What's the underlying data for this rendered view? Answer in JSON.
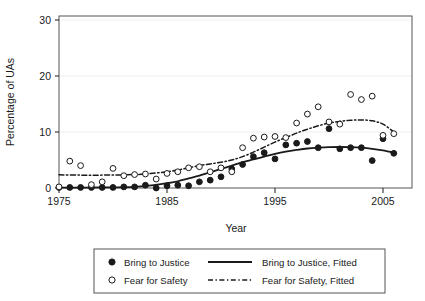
{
  "chart_data": {
    "type": "scatter",
    "title": "",
    "xlabel": "Year",
    "ylabel": "Percentage of UAs",
    "xlim": [
      1975,
      2007
    ],
    "ylim": [
      0,
      31
    ],
    "xticks": [
      1975,
      1985,
      1995,
      2005
    ],
    "yticks": [
      0,
      10,
      20,
      30
    ],
    "grid": "horizontal-faint",
    "legend_position": "below-plot",
    "x": [
      1975,
      1976,
      1977,
      1978,
      1979,
      1980,
      1981,
      1982,
      1983,
      1984,
      1985,
      1986,
      1987,
      1988,
      1989,
      1990,
      1991,
      1992,
      1993,
      1994,
      1995,
      1996,
      1997,
      1998,
      1999,
      2000,
      2001,
      2002,
      2003,
      2004,
      2005,
      2006
    ],
    "series": [
      {
        "name": "Bring to Justice",
        "marker": "filled-circle",
        "values": [
          0.1,
          0.1,
          0.1,
          0.1,
          0.1,
          0.1,
          0.2,
          0.2,
          0.5,
          0.0,
          0.4,
          0.5,
          0.4,
          1.1,
          1.4,
          2.0,
          3.4,
          4.2,
          5.6,
          6.3,
          5.2,
          7.7,
          8.0,
          8.3,
          7.2,
          10.6,
          7.0,
          7.2,
          7.2,
          4.9,
          8.8,
          6.2
        ]
      },
      {
        "name": "Fear for Safety",
        "marker": "open-circle",
        "values": [
          0.2,
          4.8,
          4.0,
          0.6,
          1.1,
          3.5,
          2.2,
          2.4,
          2.5,
          1.6,
          2.6,
          2.9,
          3.6,
          3.8,
          2.9,
          3.6,
          2.9,
          7.2,
          8.9,
          9.1,
          9.2,
          9.0,
          11.6,
          13.2,
          14.5,
          11.8,
          11.4,
          16.7,
          15.8,
          16.4,
          9.4,
          9.7
        ]
      }
    ],
    "fitted_curves": [
      {
        "name": "Bring to Justice, Fitted",
        "style": "solid",
        "points": [
          [
            1975,
            0.08
          ],
          [
            1977,
            0.08
          ],
          [
            1979,
            0.1
          ],
          [
            1981,
            0.15
          ],
          [
            1983,
            0.35
          ],
          [
            1985,
            0.85
          ],
          [
            1986,
            1.2
          ],
          [
            1987,
            1.7
          ],
          [
            1988,
            2.2
          ],
          [
            1989,
            2.8
          ],
          [
            1990,
            3.4
          ],
          [
            1991,
            4.0
          ],
          [
            1992,
            4.6
          ],
          [
            1993,
            5.1
          ],
          [
            1994,
            5.6
          ],
          [
            1995,
            6.1
          ],
          [
            1996,
            6.5
          ],
          [
            1997,
            6.8
          ],
          [
            1998,
            7.05
          ],
          [
            1999,
            7.2
          ],
          [
            2000,
            7.3
          ],
          [
            2001,
            7.32
          ],
          [
            2002,
            7.3
          ],
          [
            2003,
            7.2
          ],
          [
            2004,
            7.0
          ],
          [
            2005,
            6.7
          ],
          [
            2006,
            6.3
          ]
        ]
      },
      {
        "name": "Fear for Safety, Fitted",
        "style": "dash-dot",
        "points": [
          [
            1975,
            2.35
          ],
          [
            1977,
            2.3
          ],
          [
            1979,
            2.3
          ],
          [
            1981,
            2.35
          ],
          [
            1983,
            2.5
          ],
          [
            1985,
            2.9
          ],
          [
            1986,
            3.2
          ],
          [
            1987,
            3.6
          ],
          [
            1988,
            4.0
          ],
          [
            1989,
            4.3
          ],
          [
            1990,
            4.6
          ],
          [
            1991,
            5.0
          ],
          [
            1992,
            5.6
          ],
          [
            1993,
            6.4
          ],
          [
            1994,
            7.3
          ],
          [
            1995,
            8.2
          ],
          [
            1996,
            9.0
          ],
          [
            1997,
            9.8
          ],
          [
            1998,
            10.5
          ],
          [
            1999,
            11.1
          ],
          [
            2000,
            11.6
          ],
          [
            2001,
            11.9
          ],
          [
            2002,
            12.1
          ],
          [
            2003,
            12.15
          ],
          [
            2004,
            12.0
          ],
          [
            2005,
            11.4
          ],
          [
            2006,
            10.0
          ]
        ]
      }
    ],
    "legend": [
      {
        "label": "Bring to Justice",
        "symbol": "filled-circle"
      },
      {
        "label": "Bring to Justice, Fitted",
        "symbol": "solid-line"
      },
      {
        "label": "Fear for Safety",
        "symbol": "open-circle"
      },
      {
        "label": "Fear for Safety, Fitted",
        "symbol": "dash-dot-line"
      }
    ]
  },
  "axes": {
    "y_title": "Percentage of UAs",
    "x_title": "Year",
    "y_tick_labels": [
      "0",
      "10",
      "20",
      "30"
    ],
    "x_tick_labels": [
      "1975",
      "1985",
      "1995",
      "2005"
    ]
  },
  "legend": {
    "item_1_label": "Bring to Justice",
    "item_2_label": "Fear for Safety",
    "item_3_label": "Bring to Justice, Fitted",
    "item_4_label": "Fear for Safety, Fitted"
  },
  "colors": {
    "ink": "#1a1a1a",
    "frame": "#555555",
    "grid": "#eeeeee",
    "background": "#ffffff"
  }
}
